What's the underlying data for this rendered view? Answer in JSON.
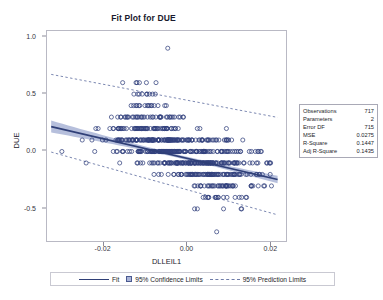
{
  "chart": {
    "title": "Fit Plot for DUE",
    "xlabel": "DLLEIL1",
    "ylabel": "DUE"
  },
  "stats": {
    "rows": [
      {
        "key": "Observations",
        "value": "717"
      },
      {
        "key": "Parameters",
        "value": "2"
      },
      {
        "key": "Error DF",
        "value": "715"
      },
      {
        "key": "MSE",
        "value": "0.0275"
      },
      {
        "key": "R-Square",
        "value": "0.1447"
      },
      {
        "key": "Adj R-Square",
        "value": "0.1435"
      }
    ]
  },
  "legend": {
    "fit": "Fit",
    "confidence": "95% Confidence Limits",
    "prediction": "95% Prediction Limits"
  },
  "colors": {
    "marker": "#33417e",
    "fit_line": "#2f3f77",
    "confidence_band": "#9aa6cf",
    "prediction_line": "#6d7ba8",
    "frame": "#b9b9c4",
    "background": "#ffffff"
  },
  "chart_data": {
    "type": "scatter",
    "title": "Fit Plot for DUE",
    "xlabel": "DLLEIL1",
    "ylabel": "DUE",
    "xlim": [
      -0.0335,
      0.0235
    ],
    "ylim": [
      -0.78,
      1.05
    ],
    "xticks": [
      -0.02,
      0.0,
      0.02
    ],
    "xticklabels": [
      "-0.02",
      "0.00",
      "0.02"
    ],
    "yticks": [
      1.0,
      0.5,
      0.0,
      -0.5
    ],
    "yticklabels": [
      "1.0",
      "0.5",
      "0.0",
      "-0.5"
    ],
    "grid": false,
    "legend_position": "bottom",
    "n_observations": 717,
    "fit": {
      "type": "line",
      "name": "Fit",
      "intercept": -0.0605,
      "slope": -8.55,
      "x_endpoints": [
        -0.0325,
        0.0215
      ],
      "y_endpoints": [
        0.217,
        -0.245
      ]
    },
    "confidence_limits": {
      "name": "95% Confidence Limits",
      "level": 0.95,
      "half_width_at_center": 0.014,
      "half_width_at_edges": 0.052
    },
    "prediction_limits": {
      "name": "95% Prediction Limits",
      "level": 0.95,
      "upper_endpoints_y": [
        0.672,
        0.297
      ],
      "lower_endpoints_y": [
        -0.005,
        -0.552
      ],
      "x_endpoints": [
        -0.0325,
        0.0215
      ]
    },
    "y_quantization": 0.1,
    "points_summary": {
      "description": "Counts of observations per DUE band (y value -> approximate count)",
      "bands": [
        {
          "y": 0.9,
          "count": 1
        },
        {
          "y": 0.6,
          "count": 6
        },
        {
          "y": 0.5,
          "count": 9
        },
        {
          "y": 0.4,
          "count": 16
        },
        {
          "y": 0.3,
          "count": 40
        },
        {
          "y": 0.2,
          "count": 66
        },
        {
          "y": 0.1,
          "count": 140
        },
        {
          "y": 0.0,
          "count": 152
        },
        {
          "y": -0.1,
          "count": 136
        },
        {
          "y": -0.2,
          "count": 86
        },
        {
          "y": -0.3,
          "count": 42
        },
        {
          "y": -0.4,
          "count": 17
        },
        {
          "y": -0.5,
          "count": 5
        },
        {
          "y": -0.7,
          "count": 1
        }
      ]
    }
  }
}
